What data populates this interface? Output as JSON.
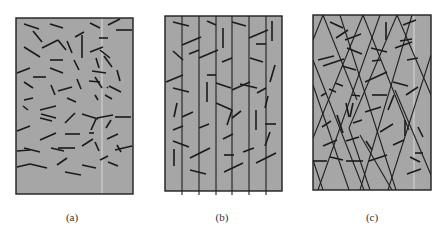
{
  "figure": {
    "colors": {
      "panel_fill": "#a6a6a6",
      "panel_border": "#1f1f1f",
      "fiber": "#1a1a1a",
      "crack_line": "#1f1f1f",
      "scan_artifact": "#d8d8d8"
    },
    "panels": [
      {
        "id": "a",
        "label": "(a)",
        "description": "Randomly oriented short fibers",
        "frame": {
          "x": 16,
          "y": 18,
          "w": 117,
          "h": 176
        },
        "label_center_x": 72,
        "long_lines": [],
        "fibers": [
          [
            24,
            24,
            39,
            29
          ],
          [
            50,
            24,
            63,
            28
          ],
          [
            90,
            23,
            100,
            28
          ],
          [
            108,
            25,
            120,
            19
          ],
          [
            116,
            30,
            132,
            30
          ],
          [
            33,
            31,
            42,
            42
          ],
          [
            75,
            37,
            84,
            32
          ],
          [
            82,
            35,
            82,
            58
          ],
          [
            99,
            38,
            108,
            38
          ],
          [
            24,
            47,
            40,
            57
          ],
          [
            42,
            48,
            58,
            40
          ],
          [
            58,
            40,
            66,
            50
          ],
          [
            67,
            41,
            72,
            53
          ],
          [
            90,
            52,
            103,
            47
          ],
          [
            100,
            50,
            110,
            58
          ],
          [
            50,
            60,
            63,
            60
          ],
          [
            74,
            60,
            79,
            70
          ],
          [
            96,
            58,
            99,
            68
          ],
          [
            104,
            56,
            112,
            67
          ],
          [
            17,
            73,
            30,
            68
          ],
          [
            50,
            68,
            63,
            73
          ],
          [
            92,
            71,
            106,
            73
          ],
          [
            117,
            70,
            120,
            81
          ],
          [
            33,
            77,
            46,
            77
          ],
          [
            77,
            79,
            81,
            89
          ],
          [
            95,
            77,
            102,
            88
          ],
          [
            109,
            86,
            121,
            92
          ],
          [
            24,
            82,
            33,
            88
          ],
          [
            51,
            85,
            55,
            95
          ],
          [
            58,
            91,
            72,
            87
          ],
          [
            89,
            81,
            100,
            82
          ],
          [
            107,
            87,
            108,
            88
          ],
          [
            24,
            100,
            33,
            98
          ],
          [
            67,
            98,
            76,
            102
          ],
          [
            95,
            95,
            98,
            100
          ],
          [
            105,
            95,
            112,
            99
          ],
          [
            23,
            106,
            28,
            110
          ],
          [
            40,
            110,
            56,
            106
          ],
          [
            41,
            114,
            56,
            118
          ],
          [
            40,
            118,
            52,
            121
          ],
          [
            65,
            123,
            75,
            113
          ],
          [
            82,
            114,
            98,
            119
          ],
          [
            97,
            118,
            113,
            115
          ],
          [
            115,
            117,
            131,
            117
          ],
          [
            91,
            130,
            96,
            119
          ],
          [
            106,
            128,
            111,
            120
          ],
          [
            17,
            131,
            30,
            126
          ],
          [
            40,
            140,
            56,
            133
          ],
          [
            65,
            134,
            80,
            134
          ],
          [
            89,
            133,
            94,
            133
          ],
          [
            107,
            139,
            118,
            134
          ],
          [
            17,
            151,
            30,
            150
          ],
          [
            24,
            148,
            40,
            152
          ],
          [
            51,
            148,
            64,
            151
          ],
          [
            58,
            148,
            75,
            148
          ],
          [
            82,
            146,
            93,
            139
          ],
          [
            95,
            142,
            99,
            151
          ],
          [
            115,
            150,
            132,
            146
          ],
          [
            117,
            145,
            121,
            152
          ],
          [
            57,
            165,
            67,
            158
          ],
          [
            100,
            160,
            108,
            156
          ],
          [
            82,
            165,
            96,
            168
          ],
          [
            108,
            162,
            118,
            166
          ],
          [
            17,
            167,
            30,
            164
          ],
          [
            30,
            164,
            47,
            168
          ],
          [
            65,
            172,
            81,
            175
          ]
        ],
        "artifact_line": {
          "x1": 102,
          "y1": 18,
          "x2": 102,
          "y2": 194
        }
      },
      {
        "id": "b",
        "label": "(b)",
        "description": "Fibers with parallel vertical crack lines",
        "frame": {
          "x": 165,
          "y": 16,
          "w": 117,
          "h": 175
        },
        "label_center_x": 222,
        "long_lines": [
          [
            182,
            16,
            182,
            195
          ],
          [
            199,
            16,
            199,
            195
          ],
          [
            216,
            16,
            216,
            195
          ],
          [
            232,
            16,
            232,
            195
          ],
          [
            249,
            16,
            249,
            195
          ],
          [
            266,
            16,
            266,
            195
          ]
        ],
        "fibers": [
          [
            173,
            22,
            189,
            26
          ],
          [
            207,
            21,
            216,
            25
          ],
          [
            232,
            22,
            246,
            26
          ],
          [
            272,
            21,
            272,
            41
          ],
          [
            182,
            45,
            201,
            37
          ],
          [
            223,
            28,
            223,
            48
          ],
          [
            249,
            38,
            268,
            30
          ],
          [
            256,
            44,
            266,
            44
          ],
          [
            173,
            51,
            183,
            60
          ],
          [
            189,
            54,
            199,
            50
          ],
          [
            199,
            58,
            218,
            50
          ],
          [
            222,
            62,
            232,
            58
          ],
          [
            250,
            58,
            263,
            62
          ],
          [
            275,
            65,
            270,
            82
          ],
          [
            166,
            82,
            183,
            75
          ],
          [
            207,
            75,
            216,
            75
          ],
          [
            216,
            83,
            231,
            88
          ],
          [
            232,
            90,
            250,
            82
          ],
          [
            240,
            84,
            257,
            88
          ],
          [
            173,
            88,
            189,
            92
          ],
          [
            207,
            82,
            207,
            102
          ],
          [
            257,
            93,
            266,
            88
          ],
          [
            268,
            96,
            265,
            108
          ],
          [
            174,
            117,
            177,
            103
          ],
          [
            182,
            117,
            193,
            112
          ],
          [
            216,
            103,
            232,
            110
          ],
          [
            232,
            110,
            227,
            125
          ],
          [
            232,
            118,
            241,
            111
          ],
          [
            256,
            110,
            256,
            130
          ],
          [
            199,
            128,
            209,
            124
          ],
          [
            173,
            130,
            183,
            126
          ],
          [
            265,
            124,
            276,
            124
          ],
          [
            265,
            146,
            270,
            132
          ],
          [
            173,
            141,
            189,
            147
          ],
          [
            223,
            139,
            233,
            134
          ],
          [
            174,
            149,
            174,
            166
          ],
          [
            190,
            158,
            210,
            148
          ],
          [
            224,
            155,
            234,
            155
          ],
          [
            243,
            152,
            254,
            148
          ],
          [
            256,
            163,
            276,
            153
          ],
          [
            190,
            170,
            206,
            174
          ],
          [
            224,
            172,
            243,
            163
          ]
        ],
        "artifact_line": null
      },
      {
        "id": "c",
        "label": "(c)",
        "description": "Fibers with crossing diagonal crack lines",
        "frame": {
          "x": 313,
          "y": 15,
          "w": 118,
          "h": 175
        },
        "label_center_x": 372,
        "long_lines": [
          [
            323,
            15,
            313,
            40
          ],
          [
            323,
            15,
            357,
            100
          ],
          [
            313,
            85,
            349,
            190
          ],
          [
            363,
            15,
            313,
            138
          ],
          [
            363,
            15,
            409,
            130
          ],
          [
            313,
            160,
            323,
            190
          ],
          [
            397,
            15,
            349,
            128
          ],
          [
            397,
            15,
            431,
            95
          ],
          [
            349,
            128,
            370,
            190
          ],
          [
            313,
            60,
            364,
            190
          ],
          [
            340,
            15,
            396,
            190
          ],
          [
            380,
            15,
            318,
            190
          ],
          [
            412,
            15,
            360,
            190
          ],
          [
            431,
            55,
            388,
            190
          ],
          [
            395,
            90,
            431,
            175
          ],
          [
            360,
            135,
            392,
            190
          ]
        ],
        "fibers": [
          [
            330,
            22,
            343,
            28
          ],
          [
            345,
            40,
            361,
            34
          ],
          [
            336,
            38,
            348,
            30
          ],
          [
            386,
            22,
            386,
            40
          ],
          [
            403,
            25,
            416,
            20
          ],
          [
            318,
            60,
            334,
            56
          ],
          [
            323,
            66,
            344,
            59
          ],
          [
            371,
            48,
            387,
            52
          ],
          [
            347,
            48,
            362,
            54
          ],
          [
            372,
            61,
            381,
            60
          ],
          [
            395,
            48,
            412,
            42
          ],
          [
            400,
            41,
            412,
            39
          ],
          [
            407,
            60,
            418,
            58
          ],
          [
            342,
            66,
            356,
            70
          ],
          [
            365,
            82,
            387,
            72
          ],
          [
            393,
            82,
            408,
            86
          ],
          [
            372,
            95,
            387,
            95
          ],
          [
            406,
            95,
            418,
            87
          ],
          [
            335,
            83,
            343,
            86
          ],
          [
            321,
            96,
            326,
            93
          ],
          [
            329,
            89,
            336,
            92
          ],
          [
            352,
            95,
            360,
            96
          ],
          [
            346,
            103,
            349,
            117
          ],
          [
            353,
            103,
            350,
            117
          ],
          [
            365,
            112,
            381,
            107
          ],
          [
            388,
            110,
            394,
            95
          ],
          [
            322,
            127,
            331,
            121
          ],
          [
            337,
            115,
            343,
            133
          ],
          [
            353,
            123,
            362,
            120
          ],
          [
            380,
            132,
            393,
            124
          ],
          [
            405,
            120,
            405,
            136
          ],
          [
            418,
            127,
            423,
            137
          ],
          [
            346,
            141,
            359,
            137
          ],
          [
            366,
            141,
            372,
            150
          ],
          [
            323,
            146,
            337,
            140
          ],
          [
            330,
            157,
            343,
            160
          ],
          [
            393,
            145,
            404,
            140
          ],
          [
            415,
            153,
            423,
            153
          ],
          [
            313,
            161,
            327,
            161
          ],
          [
            346,
            161,
            363,
            161
          ],
          [
            369,
            161,
            387,
            155
          ],
          [
            410,
            157,
            420,
            162
          ],
          [
            407,
            174,
            421,
            169
          ]
        ],
        "artifact_line": {
          "x1": 414,
          "y1": 15,
          "x2": 414,
          "y2": 190
        }
      }
    ]
  }
}
